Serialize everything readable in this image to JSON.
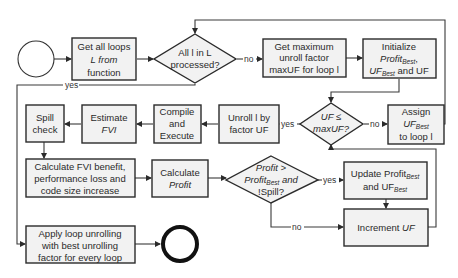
{
  "diagram": {
    "type": "flowchart",
    "colors": {
      "box_fill": "#f2f2f2",
      "stroke": "#2b2b2b",
      "background": "#ffffff"
    },
    "nodes": {
      "start": {
        "shape": "circle",
        "label": ""
      },
      "get_loops": {
        "shape": "rect",
        "lines": [
          "Get all loops",
          "L from",
          "function"
        ]
      },
      "all_processed": {
        "shape": "diamond",
        "lines": [
          "All l in L",
          "processed?"
        ]
      },
      "get_max_uf": {
        "shape": "rect",
        "lines": [
          "Get maximum",
          "unroll factor",
          "maxUF for loop l"
        ]
      },
      "initialize": {
        "shape": "rect",
        "lines": [
          "Initialize",
          "Profit",
          "Best",
          ",",
          "UF",
          "Best",
          " and UF"
        ]
      },
      "uf_le_max": {
        "shape": "diamond",
        "lines": [
          "UF ≤",
          "maxUF?"
        ]
      },
      "assign": {
        "shape": "rect",
        "lines": [
          "Assign",
          "UF",
          "Best",
          "to loop l"
        ]
      },
      "unroll": {
        "shape": "rect",
        "lines": [
          "Unroll l by",
          "factor UF"
        ]
      },
      "compile": {
        "shape": "rect",
        "lines": [
          "Compile",
          "and",
          "Execute"
        ]
      },
      "estimate": {
        "shape": "rect",
        "lines": [
          "Estimate",
          "FVI"
        ]
      },
      "spill": {
        "shape": "rect",
        "lines": [
          "Spill",
          "check"
        ]
      },
      "calc_fvi": {
        "shape": "rect",
        "lines": [
          "Calculate FVI benefit,",
          "performance loss and",
          "code size increase"
        ]
      },
      "calc_profit": {
        "shape": "rect",
        "lines": [
          "Calculate",
          "Profit"
        ]
      },
      "profit_check": {
        "shape": "diamond",
        "lines": [
          "Profit >",
          "Profit",
          "Best",
          " and",
          "!Spill?"
        ]
      },
      "update": {
        "shape": "rect",
        "lines": [
          "Update Profit",
          "Best",
          "and UF",
          "Best"
        ]
      },
      "increment": {
        "shape": "rect",
        "lines": [
          "Increment ",
          "UF"
        ]
      },
      "apply": {
        "shape": "rect",
        "lines": [
          "Apply loop unrolling",
          "with best unrolling",
          "factor for every loop"
        ]
      },
      "end": {
        "shape": "circle-bold",
        "label": ""
      }
    },
    "edge_labels": {
      "all_yes": "yes",
      "all_no": "no",
      "uf_yes": "yes",
      "uf_no": "no",
      "profit_yes": "yes",
      "profit_no": "no"
    }
  }
}
